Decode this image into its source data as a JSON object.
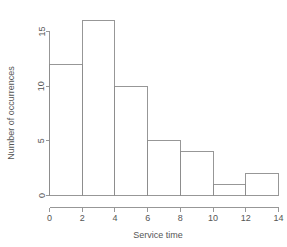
{
  "chart_data": {
    "type": "bar",
    "title": "",
    "subtitle": "",
    "xlabel": "Service time",
    "ylabel": "Number of occurrences",
    "categories": [
      "0-2",
      "2-4",
      "4-6",
      "6-8",
      "8-10",
      "10-12",
      "12-14"
    ],
    "bin_edges": [
      0,
      2,
      4,
      6,
      8,
      10,
      12,
      14
    ],
    "values": [
      12,
      16,
      10,
      5,
      4,
      1,
      2
    ],
    "xlim": [
      0,
      14
    ],
    "ylim": [
      0,
      16
    ],
    "xticks": [
      "0",
      "2",
      "4",
      "6",
      "8",
      "10",
      "12",
      "14"
    ],
    "xtick_values": [
      0,
      2,
      4,
      6,
      8,
      10,
      12,
      14
    ],
    "yticks": [
      "0",
      "5",
      "10",
      "15"
    ],
    "ytick_values": [
      0,
      5,
      10,
      15
    ],
    "grid": false,
    "legend": null,
    "colors": {
      "background": "#ffffff",
      "bar_fill": "none",
      "bar_stroke": "#8c8c8c",
      "axis": "#8c8c8c",
      "text": "#555555"
    }
  }
}
